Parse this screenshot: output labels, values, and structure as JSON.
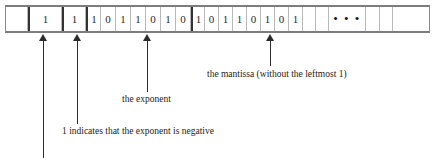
{
  "figure": {
    "kind": "floating-point-bit-layout-diagram"
  },
  "bit_strip": {
    "cells": [
      {
        "value": "",
        "type": "pad",
        "width": 22,
        "thick_left": false
      },
      {
        "value": "1",
        "type": "sign",
        "width": 34,
        "thick_left": true
      },
      {
        "value": "1",
        "type": "exp-sign",
        "width": 24,
        "thick_left": true
      },
      {
        "value": "1",
        "type": "exponent",
        "width": 15,
        "thick_left": true
      },
      {
        "value": "0",
        "type": "exponent",
        "width": 15,
        "thick_left": false
      },
      {
        "value": "1",
        "type": "exponent",
        "width": 15,
        "thick_left": false
      },
      {
        "value": "1",
        "type": "exponent",
        "width": 15,
        "thick_left": false
      },
      {
        "value": "0",
        "type": "exponent",
        "width": 15,
        "thick_left": false
      },
      {
        "value": "1",
        "type": "exponent",
        "width": 15,
        "thick_left": false
      },
      {
        "value": "0",
        "type": "exponent",
        "width": 15,
        "thick_left": false
      },
      {
        "value": "1",
        "type": "mantissa",
        "width": 14,
        "thick_left": true
      },
      {
        "value": "0",
        "type": "mantissa",
        "width": 14,
        "thick_left": false
      },
      {
        "value": "1",
        "type": "mantissa",
        "width": 14,
        "thick_left": false
      },
      {
        "value": "1",
        "type": "mantissa",
        "width": 14,
        "thick_left": false
      },
      {
        "value": "0",
        "type": "mantissa",
        "width": 14,
        "thick_left": false
      },
      {
        "value": "1",
        "type": "mantissa",
        "width": 14,
        "thick_left": false
      },
      {
        "value": "0",
        "type": "mantissa",
        "width": 14,
        "thick_left": false
      },
      {
        "value": "1",
        "type": "mantissa",
        "width": 14,
        "thick_left": false
      },
      {
        "value": "",
        "type": "mantissa-blank",
        "width": 13,
        "thick_left": false
      },
      {
        "value": "",
        "type": "mantissa-blank",
        "width": 13,
        "thick_left": false
      },
      {
        "value": "• • •",
        "type": "ellipsis",
        "width": 37,
        "thick_left": false
      },
      {
        "value": "",
        "type": "mantissa-blank",
        "width": 14,
        "thick_left": false
      },
      {
        "value": "",
        "type": "mantissa-blank",
        "width": 13,
        "thick_left": false
      },
      {
        "value": "",
        "type": "mantissa-blank",
        "width": 26,
        "thick_left": false
      }
    ]
  },
  "annotations": [
    {
      "name": "sign-bit-arrow",
      "caption": "",
      "arrow_x": 39,
      "arrow_top": 34,
      "arrow_height": 124
    },
    {
      "name": "exponent-sign-arrow",
      "caption": "1 indicates that the exponent is negative",
      "arrow_x": 73,
      "arrow_top": 34,
      "arrow_height": 90,
      "caption_x": 62,
      "caption_y": 126
    },
    {
      "name": "exponent-field-arrow",
      "caption": "the exponent",
      "arrow_x": 143,
      "arrow_top": 34,
      "arrow_height": 58,
      "caption_x": 122,
      "caption_y": 94
    },
    {
      "name": "mantissa-field-arrow",
      "caption": "the mantissa (without the leftmost 1)",
      "arrow_x": 266,
      "arrow_top": 34,
      "arrow_height": 32,
      "caption_x": 207,
      "caption_y": 69
    }
  ]
}
